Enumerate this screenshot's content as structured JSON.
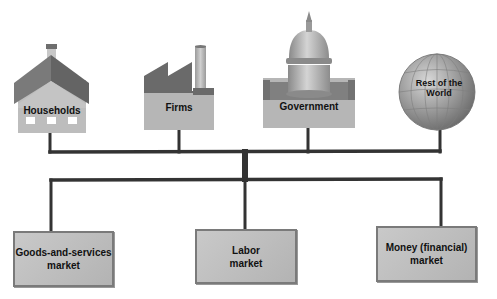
{
  "diagram": {
    "type": "hierarchy-connector",
    "colors": {
      "line": "#333333",
      "roof": "#6e6e6e",
      "wall": "#b8b8b8",
      "market_fill": "#c2c2c2",
      "market_border": "#7a7a7a"
    },
    "decision_makers": [
      {
        "id": "households",
        "label": "Households",
        "icon": "house-icon"
      },
      {
        "id": "firms",
        "label": "Firms",
        "icon": "factory-icon"
      },
      {
        "id": "government",
        "label": "Government",
        "icon": "capitol-dome-icon"
      },
      {
        "id": "rest_of_world",
        "label_line1": "Rest of the",
        "label_line2": "World",
        "icon": "globe-icon"
      }
    ],
    "markets": [
      {
        "id": "goods",
        "line1": "Goods-and-services",
        "line2": "market"
      },
      {
        "id": "labor",
        "line1": "Labor",
        "line2": "market"
      },
      {
        "id": "money",
        "line1": "Money (financial)",
        "line2": "market"
      }
    ]
  }
}
